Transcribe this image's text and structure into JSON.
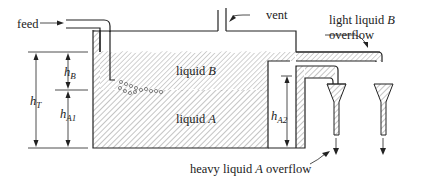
{
  "diagram": {
    "labels": {
      "feed": "feed",
      "vent": "vent",
      "light_overflow_line1": "light liquid ",
      "light_overflow_B": "B",
      "light_overflow_line2": "overflow",
      "heavy_overflow_pre": "heavy liquid ",
      "heavy_overflow_A": "A",
      "heavy_overflow_post": " overflow",
      "liquid_b_pre": "liquid ",
      "liquid_b_var": "B",
      "liquid_a_pre": "liquid ",
      "liquid_a_var": "A",
      "hB_main": "h",
      "hB_sub": "B",
      "hT_main": "h",
      "hT_sub": "T",
      "hA1_main": "h",
      "hA1_sub": "A1",
      "hA2_main": "h",
      "hA2_sub": "A2"
    }
  }
}
